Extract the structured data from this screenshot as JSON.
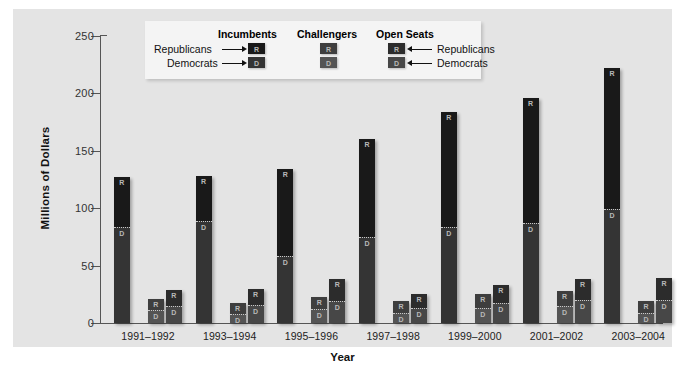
{
  "chart_data": {
    "type": "bar",
    "subtype": "grouped-stacked",
    "title": "",
    "xlabel": "Year",
    "ylabel": "Millions of Dollars",
    "ylim": [
      0,
      250
    ],
    "yticks": [
      0,
      50,
      100,
      150,
      200,
      250
    ],
    "grid": false,
    "legend_position": "top-center-inside",
    "categories": [
      "1991–1992",
      "1993–1994",
      "1995–1996",
      "1997–1998",
      "1999–2000",
      "2001–2002",
      "2003–2004"
    ],
    "groups": [
      "Incumbents",
      "Challengers",
      "Open Seats"
    ],
    "stack_order_bottom_to_top": [
      "Democrats",
      "Republicans"
    ],
    "series": [
      {
        "name": "Incumbents – Democrats",
        "group": "Incumbents",
        "party": "D",
        "values": [
          84,
          89,
          58,
          75,
          84,
          87,
          99
        ]
      },
      {
        "name": "Incumbents – Republicans",
        "group": "Incumbents",
        "party": "R",
        "values": [
          43,
          39,
          76,
          85,
          100,
          109,
          123
        ]
      },
      {
        "name": "Challengers – Democrats",
        "group": "Challengers",
        "party": "D",
        "values": [
          11,
          8,
          12,
          9,
          13,
          15,
          9
        ]
      },
      {
        "name": "Challengers – Republicans",
        "group": "Challengers",
        "party": "R",
        "values": [
          10,
          9,
          11,
          10,
          12,
          13,
          10
        ]
      },
      {
        "name": "Open Seats – Democrats",
        "group": "Open Seats",
        "party": "D",
        "values": [
          15,
          16,
          19,
          13,
          17,
          20,
          20
        ]
      },
      {
        "name": "Open Seats – Republicans",
        "group": "Open Seats",
        "party": "R",
        "values": [
          14,
          14,
          19,
          12,
          16,
          18,
          19
        ]
      }
    ],
    "totals": {
      "Incumbents": [
        127,
        128,
        134,
        160,
        184,
        196,
        222
      ],
      "Challengers": [
        21,
        17,
        23,
        19,
        25,
        28,
        19
      ],
      "Open Seats": [
        29,
        30,
        38,
        25,
        33,
        38,
        39
      ]
    }
  },
  "axes": {
    "ylabel": "Millions of Dollars",
    "xlabel": "Year",
    "ytick_labels": [
      "250",
      "200",
      "150",
      "100",
      "50",
      "0"
    ],
    "xtick_labels": [
      "1991–1992",
      "1993–1994",
      "1995–1996",
      "1997–1998",
      "1999–2000",
      "2001–2002",
      "2003–2004"
    ]
  },
  "legend": {
    "headings": {
      "incumbents": "Incumbents",
      "challengers": "Challengers",
      "open_seats": "Open Seats"
    },
    "left_labels": {
      "republicans": "Republicans",
      "democrats": "Democrats"
    },
    "right_labels": {
      "republicans": "Republicans",
      "democrats": "Democrats"
    },
    "swatch_letters": {
      "republican": "R",
      "democrat": "D"
    }
  },
  "colors": {
    "panel_background": "#e4e4e4",
    "legend_background": "#f4f4f4",
    "republican_incumbent": "#191919",
    "democrat_incumbent": "#343434",
    "republican_challenger": "#3e3e3e",
    "democrat_challenger": "#545454",
    "republican_open": "#2c2c2c",
    "democrat_open": "#474747",
    "axis": "#555555"
  }
}
